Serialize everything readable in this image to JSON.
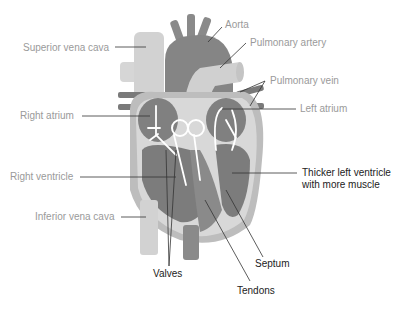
{
  "colors": {
    "background": "#ffffff",
    "vessel_light": "#d4d4d4",
    "chamber_dark": "#7a7a7a",
    "aorta": "#858585",
    "wall": "#a8a8a8",
    "flow_arrows": "#ffffff",
    "label_grey": "#9a9a9a",
    "label_dark": "#222222"
  },
  "labels": {
    "superior_vena_cava": "Superior vena cava",
    "aorta": "Aorta",
    "pulmonary_artery": "Pulmonary artery",
    "pulmonary_vein": "Pulmonary vein",
    "left_atrium": "Left atrium",
    "right_atrium": "Right atrium",
    "right_ventricle": "Right ventricle",
    "thicker_left_ventricle_line1": "Thicker left ventricle",
    "thicker_left_ventricle_line2": "with more muscle",
    "inferior_vena_cava": "Inferior vena cava",
    "valves": "Valves",
    "septum": "Septum",
    "tendons": "Tendons"
  }
}
